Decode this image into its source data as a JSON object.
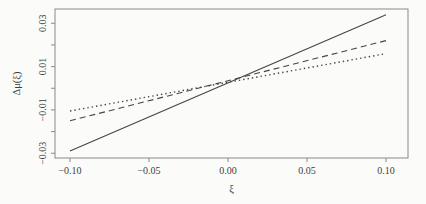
{
  "figure": {
    "background": "#fbfbf9",
    "frame_color": "#8a8a86",
    "tick_color": "#8a8a86",
    "line_color": "#454545",
    "text_color": "#3d3d3d"
  },
  "chart_data": {
    "type": "line",
    "title": "",
    "xlabel": "ξ",
    "ylabel": "Δμ(ξ)",
    "xlim": [
      -0.1095,
      0.1139
    ],
    "ylim": [
      -0.0322,
      0.0366
    ],
    "grid": false,
    "legend": "none",
    "x_ticks": [
      {
        "value": -0.1,
        "label": "−0.10"
      },
      {
        "value": -0.05,
        "label": "−0.05"
      },
      {
        "value": 0.0,
        "label": "0.00"
      },
      {
        "value": 0.05,
        "label": "0.05"
      },
      {
        "value": 0.1,
        "label": "0.10"
      }
    ],
    "y_ticks": [
      {
        "value": -0.03,
        "label": "−0.03"
      },
      {
        "value": -0.02,
        "label": ""
      },
      {
        "value": -0.01,
        "label": "−0.01"
      },
      {
        "value": 0.0,
        "label": ""
      },
      {
        "value": 0.01,
        "label": "0.01"
      },
      {
        "value": 0.02,
        "label": ""
      },
      {
        "value": 0.03,
        "label": "0.03"
      }
    ],
    "series": [
      {
        "name": "solid",
        "style": "solid",
        "x": [
          -0.1,
          0.1
        ],
        "y": [
          -0.029,
          0.034
        ]
      },
      {
        "name": "dashed",
        "style": "dashed",
        "x": [
          -0.1,
          0.1
        ],
        "y": [
          -0.015,
          0.022
        ]
      },
      {
        "name": "dotted",
        "style": "dotted",
        "x": [
          -0.1,
          0.1
        ],
        "y": [
          -0.0105,
          0.016
        ]
      }
    ]
  }
}
